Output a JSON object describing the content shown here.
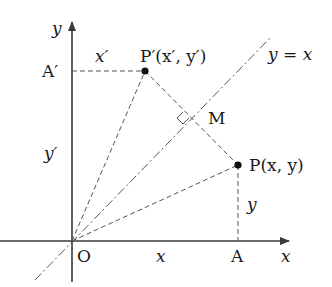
{
  "diagram": {
    "axes": {
      "x_label": "x",
      "y_label": "y",
      "origin_label": "O"
    },
    "line": {
      "label": "y = x",
      "style": "dash-dot"
    },
    "points": {
      "P": {
        "label": "P(x, y)",
        "name": "P"
      },
      "P_prime": {
        "label": "P′(x′, y′)",
        "name": "P′"
      },
      "M": {
        "label": "M"
      },
      "A": {
        "label": "A"
      },
      "A_prime": {
        "label": "A′"
      }
    },
    "segment_labels": {
      "x_prime": "x′",
      "y_prime": "y′",
      "x": "x",
      "y": "y"
    },
    "colors": {
      "axis": "#3a3a3a",
      "dashed": "#555555",
      "point": "#111111",
      "text": "#1a1a1a"
    }
  }
}
